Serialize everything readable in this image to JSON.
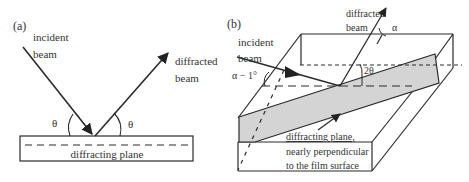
{
  "panel_a": {
    "label": "(a)",
    "incident_line1": "incident",
    "incident_line2": "beam",
    "diffracted_line1": "diffracted",
    "diffracted_line2": "beam",
    "theta_left": "θ",
    "theta_right": "θ",
    "plane_label": "diffracting plane"
  },
  "panel_b": {
    "label": "(b)",
    "incident_line1": "incident",
    "incident_line2": "beam",
    "diffracted_line1": "diffracted",
    "diffracted_line2": "beam",
    "alpha": "α",
    "alpha_minus": "α − 1°",
    "two_theta": "2θ",
    "plane_line1": "diffracting plane,",
    "plane_line2": "nearly perpendicular",
    "plane_line3": "to the film surface"
  },
  "colors": {
    "line": "#2a2a2a",
    "plane_fill": "#d4d4d4",
    "text": "#333333"
  }
}
